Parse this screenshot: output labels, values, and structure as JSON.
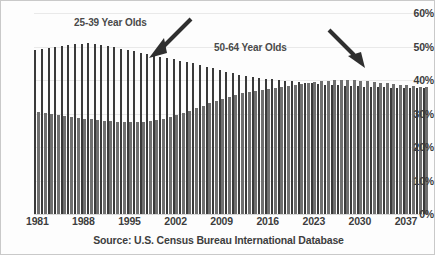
{
  "chart_data": {
    "type": "bar",
    "title": "",
    "xlabel": "",
    "ylabel": "",
    "ylim": [
      0,
      60
    ],
    "ytick_labels": [
      "0%",
      "10%",
      "20%",
      "30%",
      "40%",
      "50%",
      "60%"
    ],
    "ytick_values": [
      0,
      10,
      20,
      30,
      40,
      50,
      60
    ],
    "xtick_labels": [
      "1981",
      "1988",
      "1995",
      "2002",
      "2009",
      "2016",
      "2023",
      "2030",
      "2037"
    ],
    "xtick_values": [
      1981,
      1988,
      1995,
      2002,
      2009,
      2016,
      2023,
      2030,
      2037
    ],
    "grid": true,
    "legend": "annotations",
    "source": "Source: U.S. Census Bureau International Database",
    "categories": [
      1981,
      1982,
      1983,
      1984,
      1985,
      1986,
      1987,
      1988,
      1989,
      1990,
      1991,
      1992,
      1993,
      1994,
      1995,
      1996,
      1997,
      1998,
      1999,
      2000,
      2001,
      2002,
      2003,
      2004,
      2005,
      2006,
      2007,
      2008,
      2009,
      2010,
      2011,
      2012,
      2013,
      2014,
      2015,
      2016,
      2017,
      2018,
      2019,
      2020,
      2021,
      2022,
      2023,
      2024,
      2025,
      2026,
      2027,
      2028,
      2029,
      2030,
      2031,
      2032,
      2033,
      2034,
      2035,
      2036,
      2037,
      2038,
      2039,
      2040
    ],
    "series": [
      {
        "name": "25-39 Year Olds",
        "color": "#3a3a3a",
        "values": [
          49.0,
          49.3,
          49.6,
          50.0,
          50.2,
          50.5,
          50.7,
          50.9,
          51.0,
          50.8,
          50.5,
          50.2,
          49.8,
          49.4,
          49.0,
          48.6,
          48.2,
          47.8,
          47.4,
          47.0,
          46.6,
          46.2,
          45.8,
          45.4,
          45.0,
          44.5,
          44.0,
          43.5,
          43.0,
          42.5,
          42.0,
          41.6,
          41.2,
          40.9,
          40.6,
          40.4,
          40.2,
          40.0,
          39.8,
          39.6,
          39.4,
          39.2,
          39.0,
          38.8,
          38.6,
          38.5,
          38.4,
          38.3,
          38.2,
          38.1,
          38.0,
          37.9,
          37.8,
          37.8,
          37.7,
          37.7,
          37.6,
          37.6,
          37.5,
          37.5
        ]
      },
      {
        "name": "50-64 Year Olds",
        "color": "#6f6f6f",
        "values": [
          30.4,
          30.2,
          30.0,
          29.7,
          29.4,
          29.1,
          28.8,
          28.5,
          28.3,
          28.1,
          27.9,
          27.7,
          27.6,
          27.5,
          27.4,
          27.4,
          27.5,
          27.7,
          28.0,
          28.4,
          28.9,
          29.5,
          30.2,
          30.9,
          31.6,
          32.3,
          33.0,
          33.7,
          34.4,
          35.0,
          35.5,
          36.0,
          36.4,
          36.8,
          37.1,
          37.4,
          37.7,
          38.0,
          38.3,
          38.6,
          38.9,
          39.2,
          39.4,
          39.6,
          39.8,
          39.9,
          40.0,
          40.0,
          39.9,
          39.8,
          39.6,
          39.4,
          39.2,
          39.0,
          38.8,
          38.6,
          38.4,
          38.2,
          38.0,
          37.9
        ]
      }
    ],
    "annotations": [
      {
        "text": "25-39 Year Olds",
        "arrow": "down-right"
      },
      {
        "text": "50-64 Year Olds",
        "arrow": "down-right"
      }
    ]
  }
}
